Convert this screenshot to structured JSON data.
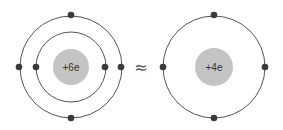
{
  "diagram": {
    "left_atom": {
      "nucleus_label": "+6e",
      "center": [
        71,
        67
      ],
      "nucleus_radius": 18,
      "orbits": [
        {
          "radius": 35,
          "electrons": [
            [
              36,
              67
            ],
            [
              105,
              67
            ]
          ]
        },
        {
          "radius": 51,
          "electrons": [
            [
              71,
              15
            ],
            [
              71,
              118
            ],
            [
              19,
              67
            ],
            [
              121,
              67
            ]
          ]
        }
      ]
    },
    "relation_symbol": "≈",
    "right_atom": {
      "nucleus_label": "+4e",
      "center": [
        214,
        67
      ],
      "nucleus_radius": 19,
      "orbits": [
        {
          "radius": 51,
          "electrons": [
            [
              214,
              15
            ],
            [
              214,
              118
            ],
            [
              163,
              67
            ],
            [
              265,
              67
            ]
          ]
        }
      ]
    },
    "colors": {
      "nucleus": "#c4c4c4",
      "orbit": "#555555",
      "electron": "#3a3a3a",
      "text": "#333333"
    }
  }
}
